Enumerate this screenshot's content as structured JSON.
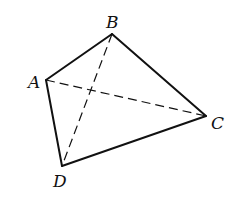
{
  "diagram": {
    "type": "tetrahedron-quadrilateral",
    "stroke_color": "#111111",
    "background": "#ffffff",
    "vertices": {
      "A": {
        "label": "A",
        "x": 46,
        "y": 80,
        "label_x": 28,
        "label_y": 88
      },
      "B": {
        "label": "B",
        "x": 112,
        "y": 34,
        "label_x": 106,
        "label_y": 28
      },
      "C": {
        "label": "C",
        "x": 206,
        "y": 116,
        "label_x": 211,
        "label_y": 129
      },
      "D": {
        "label": "D",
        "x": 62,
        "y": 166,
        "label_x": 53,
        "label_y": 187
      }
    },
    "solid_edges": [
      [
        "A",
        "B"
      ],
      [
        "B",
        "C"
      ],
      [
        "C",
        "D"
      ],
      [
        "D",
        "A"
      ]
    ],
    "dashed_edges": [
      [
        "B",
        "D"
      ],
      [
        "A",
        "C"
      ]
    ]
  }
}
